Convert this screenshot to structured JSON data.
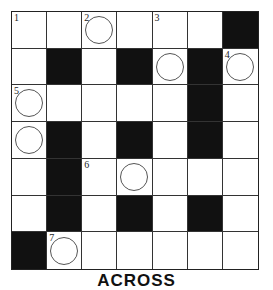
{
  "puzzle": {
    "rows": 7,
    "cols": 7,
    "colors": {
      "black": "#111111",
      "white": "#ffffff",
      "line": "#333333"
    },
    "grid": [
      [
        {
          "n": "1"
        },
        {},
        {
          "n": "2",
          "c": 1
        },
        {},
        {
          "n": "3"
        },
        {},
        {
          "b": 1
        }
      ],
      [
        {},
        {
          "b": 1
        },
        {},
        {
          "b": 1
        },
        {
          "c": 1
        },
        {
          "b": 1
        },
        {
          "n": "4",
          "c": 1
        }
      ],
      [
        {
          "n": "5",
          "c": 1
        },
        {},
        {},
        {},
        {},
        {
          "b": 1
        },
        {}
      ],
      [
        {
          "c": 1
        },
        {
          "b": 1
        },
        {},
        {
          "b": 1
        },
        {},
        {
          "b": 1
        },
        {}
      ],
      [
        {},
        {
          "b": 1
        },
        {
          "n": "6"
        },
        {
          "c": 1
        },
        {},
        {},
        {}
      ],
      [
        {},
        {
          "b": 1
        },
        {},
        {
          "b": 1
        },
        {},
        {
          "b": 1
        },
        {}
      ],
      [
        {
          "b": 1
        },
        {
          "n": "7",
          "c": 1
        },
        {},
        {},
        {},
        {},
        {}
      ]
    ]
  },
  "clues": {
    "heading": "ACROSS"
  }
}
